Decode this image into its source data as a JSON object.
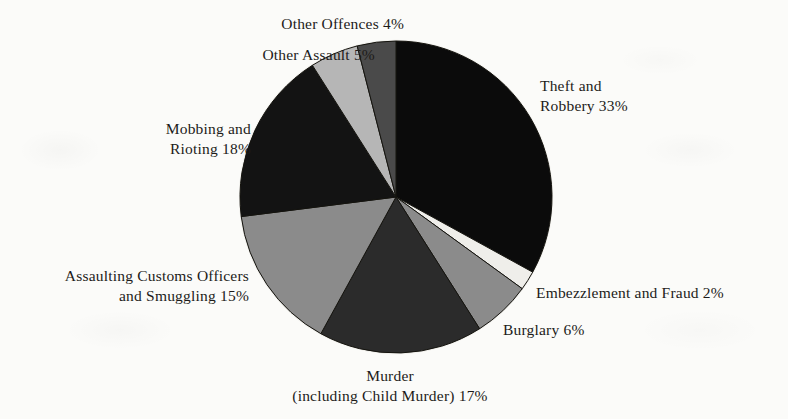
{
  "page": {
    "background_color": "#fbfbf9",
    "text_color": "#1d1b19"
  },
  "chart_data": {
    "type": "pie",
    "title": "",
    "subtitle": "",
    "xlabel": "",
    "ylabel": "",
    "legend_position": "callout-labels",
    "grid": false,
    "units": "percent",
    "total": 100,
    "start_angle_deg": 0,
    "direction": "clockwise",
    "center": {
      "x": 396,
      "y": 197
    },
    "radius": 156,
    "categories": [
      "Theft and Robbery",
      "Embezzlement and Fraud",
      "Burglary",
      "Murder (including Child Murder)",
      "Assaulting Customs Officers and Smuggling",
      "Mobbing and Rioting",
      "Other Assault",
      "Other Offences"
    ],
    "values": [
      33,
      2,
      6,
      17,
      15,
      18,
      5,
      4
    ],
    "colors": [
      "#0b0b0b",
      "#efeeea",
      "#8b8b8b",
      "#2b2b2b",
      "#8b8b8b",
      "#131313",
      "#b6b6b6",
      "#4a4a4a"
    ],
    "slices": [
      {
        "name": "Theft and Robbery",
        "value": 33,
        "label": "Theft and\nRobbery 33%",
        "label_lines": [
          "Theft and",
          "Robbery 33%"
        ],
        "color": "#0b0b0b",
        "label_x": 540,
        "label_y": 76,
        "label_align": "right"
      },
      {
        "name": "Embezzlement and Fraud",
        "value": 2,
        "label": "Embezzlement and Fraud 2%",
        "label_lines": [
          "Embezzlement and Fraud 2%"
        ],
        "color": "#efeeea",
        "label_x": 536,
        "label_y": 283,
        "label_align": "right"
      },
      {
        "name": "Burglary",
        "value": 6,
        "label": "Burglary 6%",
        "label_lines": [
          "Burglary 6%"
        ],
        "color": "#8b8b8b",
        "label_x": 503,
        "label_y": 320,
        "label_align": "right"
      },
      {
        "name": "Murder (including Child Murder)",
        "value": 17,
        "label": "Murder\n(including Child Murder) 17%",
        "label_lines": [
          "Murder",
          "(including Child Murder) 17%"
        ],
        "color": "#2b2b2b",
        "label_x": 390,
        "label_y": 366,
        "label_align": "center"
      },
      {
        "name": "Assaulting Customs Officers and Smuggling",
        "value": 15,
        "label": "Assaulting Customs Officers\nand Smuggling 15%",
        "label_lines": [
          "Assaulting Customs Officers",
          "and Smuggling 15%"
        ],
        "color": "#8b8b8b",
        "label_x": 249,
        "label_y": 266,
        "label_align": "left"
      },
      {
        "name": "Mobbing and Rioting",
        "value": 18,
        "label": "Mobbing and\nRioting 18%",
        "label_lines": [
          "Mobbing and",
          "Rioting 18%"
        ],
        "color": "#131313",
        "label_x": 251,
        "label_y": 119,
        "label_align": "left"
      },
      {
        "name": "Other Assault",
        "value": 5,
        "label": "Other Assault 5%",
        "label_lines": [
          "Other Assault 5%"
        ],
        "color": "#b6b6b6",
        "label_x": 375,
        "label_y": 45,
        "label_align": "left"
      },
      {
        "name": "Other Offences",
        "value": 4,
        "label": "Other Offences 4%",
        "label_lines": [
          "Other Offences 4%"
        ],
        "color": "#4a4a4a",
        "label_x": 404,
        "label_y": 14,
        "label_align": "left"
      }
    ]
  }
}
